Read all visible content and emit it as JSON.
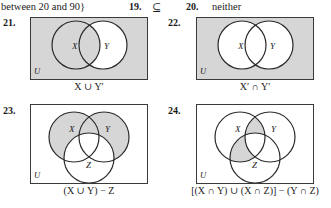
{
  "page": {
    "width": 331,
    "height": 208,
    "background": "#ffffff",
    "shade_color": "#d6d6d6",
    "stroke_color": "#2b2b2b",
    "box_border_color": "#3a3a3a"
  },
  "answer_strip": {
    "continued_text": "between 20 and 90}",
    "items": [
      {
        "number": "19.",
        "answer": "⊆"
      },
      {
        "number": "20.",
        "answer": "neither"
      }
    ]
  },
  "problems": [
    {
      "number": "21.",
      "type": "two-set",
      "set_labels": [
        "X",
        "Y"
      ],
      "universe_label": "U",
      "caption": "X ∪ Y′",
      "caption_parts": {
        "left_set": "X",
        "operator": "∪",
        "right_set": "Y′"
      },
      "shaded_description": "universe-and-X-shaded-Y-only-white",
      "shaded_regions": [
        "universe-outside-circles",
        "X-only",
        "X-intersect-Y"
      ],
      "unshaded_regions": [
        "Y-only"
      ]
    },
    {
      "number": "22.",
      "type": "two-set",
      "set_labels": [
        "X",
        "Y"
      ],
      "universe_label": "U",
      "caption": "X′ ∩ Y′",
      "caption_parts": {
        "left_set": "X′",
        "operator": "∩",
        "right_set": "Y′"
      },
      "shaded_description": "only-universe-outside-both-circles-shaded",
      "shaded_regions": [
        "universe-outside-circles"
      ],
      "unshaded_regions": [
        "X-only",
        "X-intersect-Y",
        "Y-only"
      ]
    },
    {
      "number": "23.",
      "type": "three-set",
      "set_labels": [
        "X",
        "Y",
        "Z"
      ],
      "universe_label": "U",
      "caption": "(X ∪ Y) − Z",
      "shaded_description": "X-union-Y-minus-Z-shaded-universe-white",
      "shaded_regions": [
        "X-only",
        "Y-only",
        "X-intersect-Y-only"
      ],
      "unshaded_regions": [
        "universe-outside-circles",
        "Z-only",
        "X-intersect-Z-only",
        "Y-intersect-Z-only",
        "X-intersect-Y-intersect-Z"
      ]
    },
    {
      "number": "24.",
      "type": "three-set",
      "set_labels": [
        "X",
        "Y",
        "Z"
      ],
      "universe_label": "U",
      "caption": "[(X ∩ Y) ∪ (X ∩ Z)] − (Y ∩ Z)",
      "shaded_description": "two-lens-regions-shaded",
      "shaded_regions": [
        "X-intersect-Y-only",
        "X-intersect-Z-only"
      ],
      "unshaded_regions": [
        "universe-outside-circles",
        "X-only",
        "Y-only",
        "Z-only",
        "Y-intersect-Z-only",
        "X-intersect-Y-intersect-Z"
      ]
    }
  ]
}
